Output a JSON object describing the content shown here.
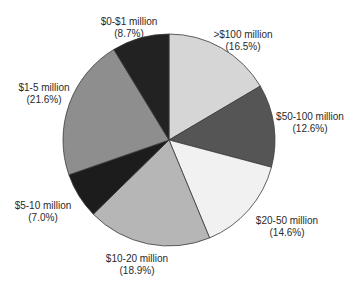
{
  "chart_data": {
    "type": "pie",
    "title": "",
    "start_angle_deg": 0,
    "direction": "clockwise",
    "center": [
      169,
      140
    ],
    "radius": 106,
    "slices": [
      {
        "label": ">$100 million",
        "value": 16.5,
        "pct_label": "(16.5%)",
        "color": "#d6d6d6",
        "label_pos": [
          243,
          29
        ]
      },
      {
        "label": "$50-100 million",
        "value": 12.6,
        "pct_label": "(12.6%)",
        "color": "#555555",
        "label_pos": [
          310,
          111
        ]
      },
      {
        "label": "$20-50 million",
        "value": 14.6,
        "pct_label": "(14.6%)",
        "color": "#f1f1f1",
        "label_pos": [
          287,
          215
        ]
      },
      {
        "label": "$10-20 million",
        "value": 18.9,
        "pct_label": "(18.9%)",
        "color": "#b6b6b6",
        "label_pos": [
          137,
          253
        ]
      },
      {
        "label": "$5-10 million",
        "value": 7.0,
        "pct_label": "(7.0%)",
        "color": "#1c1c1c",
        "label_pos": [
          43,
          200
        ]
      },
      {
        "label": "$1-5 million",
        "value": 21.6,
        "pct_label": "(21.6%)",
        "color": "#8e8e8e",
        "label_pos": [
          44,
          82
        ]
      },
      {
        "label": "$0-$1 million",
        "value": 8.7,
        "pct_label": "(8.7%)",
        "color": "#222222",
        "label_pos": [
          129,
          16
        ]
      }
    ],
    "legend": null
  }
}
